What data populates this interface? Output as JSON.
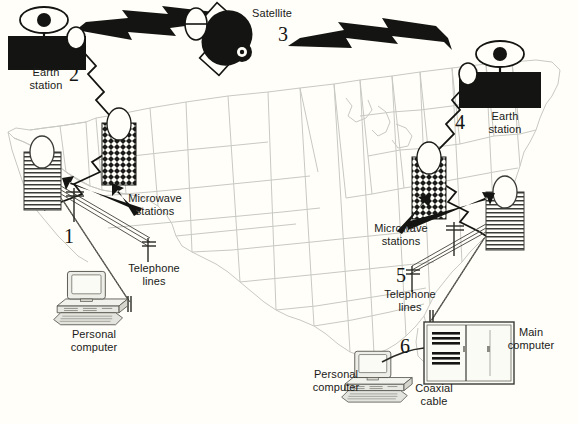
{
  "diagram": {
    "background_color": "#fffef8",
    "ink_color": "#141412",
    "map_line_color": "#c9c9c4"
  },
  "labels": {
    "earth_station_west": "Earth\nstation",
    "earth_station_east": "Earth\nstation",
    "satellite": "Satellite",
    "microwave_stations_west": "Microwave\nstations",
    "microwave_stations_east": "Microwave\nstations",
    "telephone_lines_west": "Telephone\nlines",
    "telephone_lines_east": "Telephone\nlines",
    "personal_computer_west": "Personal\ncomputer",
    "personal_computer_east": "Personal\ncomputer",
    "main_computer": "Main\ncomputer",
    "coaxial_cable": "Coaxial\ncable"
  },
  "callout_numbers": {
    "one": "1",
    "two": "2",
    "three": "3",
    "four": "4",
    "five": "5",
    "six": "6"
  },
  "components": [
    {
      "id": "personal-computer-west",
      "number": "1",
      "label": "Personal computer"
    },
    {
      "id": "earth-station-west",
      "number": "2",
      "label": "Earth station"
    },
    {
      "id": "satellite",
      "number": "3",
      "label": "Satellite"
    },
    {
      "id": "earth-station-east",
      "number": "4",
      "label": "Earth station"
    },
    {
      "id": "telephone-lines-east",
      "number": "5",
      "label": "Telephone lines"
    },
    {
      "id": "personal-computer-east",
      "number": "6",
      "label": "Personal computer"
    }
  ]
}
